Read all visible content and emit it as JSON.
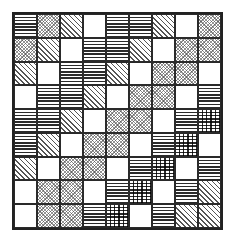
{
  "diagram": {
    "type": "pattern-grid",
    "rows": 9,
    "columns": 9,
    "legend": {
      "H": "horizontal-lines",
      "D": "fine-crosshatch-dots",
      "S": "diagonal-stripes",
      "E": "empty",
      "G": "plaid-grid"
    },
    "cells": [
      [
        "H",
        "D",
        "S",
        "E",
        "H",
        "H",
        "S",
        "E",
        "D"
      ],
      [
        "D",
        "S",
        "E",
        "H",
        "H",
        "S",
        "E",
        "D",
        "D"
      ],
      [
        "S",
        "E",
        "H",
        "H",
        "S",
        "E",
        "D",
        "D",
        "E"
      ],
      [
        "E",
        "H",
        "H",
        "S",
        "E",
        "D",
        "D",
        "E",
        "H"
      ],
      [
        "H",
        "H",
        "S",
        "E",
        "D",
        "D",
        "E",
        "H",
        "G"
      ],
      [
        "H",
        "S",
        "E",
        "D",
        "D",
        "E",
        "H",
        "G",
        "E"
      ],
      [
        "S",
        "E",
        "D",
        "D",
        "E",
        "H",
        "G",
        "E",
        "H"
      ],
      [
        "E",
        "D",
        "D",
        "E",
        "H",
        "G",
        "E",
        "H",
        "S"
      ],
      [
        "E",
        "D",
        "D",
        "H",
        "G",
        "E",
        "H",
        "S",
        "S"
      ]
    ]
  }
}
